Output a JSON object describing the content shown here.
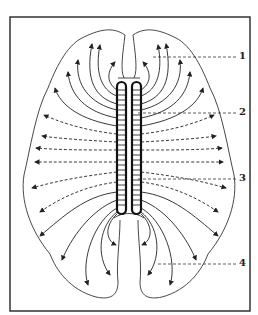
{
  "diagram": {
    "colors": {
      "stroke": "#222222",
      "background": "#ffffff",
      "frame": "#333333"
    },
    "labels": [
      {
        "id": "1",
        "text": "1"
      },
      {
        "id": "2",
        "text": "2"
      },
      {
        "id": "3",
        "text": "3"
      },
      {
        "id": "4",
        "text": "4"
      }
    ]
  }
}
